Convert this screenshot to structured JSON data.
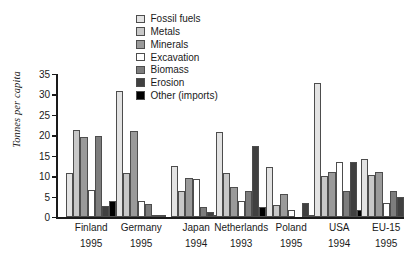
{
  "chart_data": {
    "type": "bar",
    "title": "",
    "subtitle": "",
    "xlabel": "",
    "ylabel": "Tonnes per capita",
    "ylim": [
      0,
      35
    ],
    "yticks": [
      0,
      5,
      10,
      15,
      20,
      25,
      30,
      35
    ],
    "grid": false,
    "legend_position": "top-center",
    "categories": [
      "Finland",
      "Germany",
      "Japan",
      "Netherlands",
      "Poland",
      "USA",
      "EU-15"
    ],
    "category_years": [
      "1995",
      "1995",
      "1994",
      "1993",
      "1995",
      "1994",
      "1995"
    ],
    "series": [
      {
        "name": "Fossil fuels",
        "color": "#e3e3e3",
        "values": [
          10.7,
          30.8,
          12.4,
          20.8,
          12.2,
          32.8,
          14.2
        ]
      },
      {
        "name": "Metals",
        "color": "#c8c8c8",
        "values": [
          21.4,
          10.7,
          6.3,
          10.8,
          3.0,
          10.0,
          10.4
        ]
      },
      {
        "name": "Minerals",
        "color": "#9a9a9a",
        "values": [
          19.5,
          21.0,
          9.6,
          7.3,
          5.7,
          11.1,
          10.9
        ]
      },
      {
        "name": "Excavation",
        "color": "#ffffff",
        "values": [
          6.7,
          3.8,
          9.4,
          3.8,
          1.6,
          13.4,
          3.4
        ]
      },
      {
        "name": "Biomass",
        "color": "#7d7d7d",
        "values": [
          19.9,
          3.2,
          2.4,
          6.3,
          0.0,
          6.3,
          6.4
        ]
      },
      {
        "name": "Erosion",
        "color": "#404040",
        "values": [
          2.6,
          0.5,
          1.3,
          17.5,
          3.4,
          13.4,
          5.0
        ]
      },
      {
        "name": "Other (imports)",
        "color": "#000000",
        "values": [
          3.8,
          0.3,
          0.2,
          2.4,
          0.3,
          1.7,
          0.0
        ]
      }
    ],
    "legend": [
      "Fossil fuels",
      "Metals",
      "Minerals",
      "Excavation",
      "Biomass",
      "Erosion",
      "Other (imports)"
    ]
  }
}
